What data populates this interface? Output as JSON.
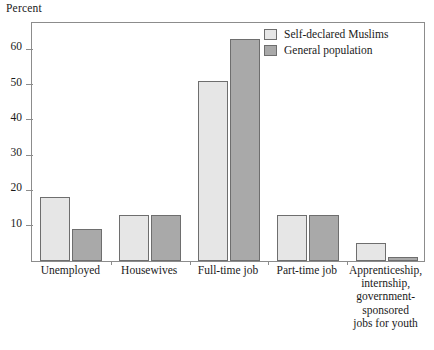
{
  "chart_data": {
    "type": "bar",
    "title": "",
    "subtitle": "",
    "xlabel": "",
    "ylabel": "Percent",
    "ylim": [
      0,
      68
    ],
    "yticks": [
      10,
      20,
      30,
      40,
      50,
      60
    ],
    "ytick_labels": [
      "10",
      "20",
      "30",
      "40",
      "50",
      "60"
    ],
    "grid": false,
    "legend_position": "top-right",
    "categories": [
      "Unemployed",
      "Housewives",
      "Full-time job",
      "Part-time job",
      "Apprenticeship,\ninternship,\ngovernment-\nsponsored\njobs for youth"
    ],
    "series": [
      {
        "name": "Self-declared Muslims",
        "color": "#e6e6e6",
        "values": [
          18,
          13,
          51,
          13,
          5
        ]
      },
      {
        "name": "General population",
        "color": "#a9a9a9",
        "values": [
          9,
          13,
          63,
          13,
          1
        ]
      }
    ]
  },
  "legend": {
    "entries": [
      {
        "label": "Self-declared Muslims"
      },
      {
        "label": "General population"
      }
    ]
  }
}
